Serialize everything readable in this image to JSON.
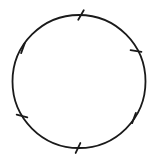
{
  "diagram": {
    "type": "circle-divided-into-equal-arcs",
    "background": "#ffffff",
    "stroke_color": "#1a1a1a",
    "stroke_width": 1.8,
    "circle": {
      "cx": 79,
      "cy": 81.5,
      "r": 66.5
    },
    "tick_count": 6,
    "tick_length": 11,
    "ticks": [
      {
        "x": 81,
        "y": 15,
        "angle_deg": -60
      },
      {
        "x": 136,
        "y": 51,
        "angle_deg": 10
      },
      {
        "x": 134,
        "y": 118,
        "angle_deg": -70
      },
      {
        "x": 78,
        "y": 148,
        "angle_deg": -65
      },
      {
        "x": 22,
        "y": 116,
        "angle_deg": 15
      },
      {
        "x": 23,
        "y": 48,
        "angle_deg": -70
      }
    ]
  }
}
